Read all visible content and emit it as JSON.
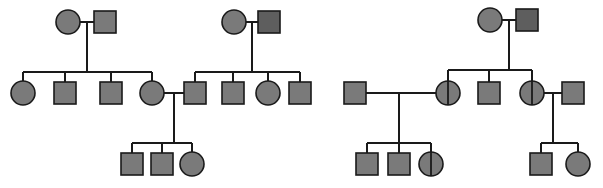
{
  "figure": {
    "width": 603,
    "height": 188,
    "background": "#ffffff"
  },
  "legend": {
    "shape_male": "square",
    "shape_female": "circle",
    "fill_affected_light": "#7a7a7a",
    "fill_affected_dark": "#5e5e5e",
    "stroke": "#1a1a1a",
    "line_color": "#1a1a1a",
    "carrier_marker": "vertical-line"
  },
  "chart_data": {
    "type": "diagram",
    "diagram_kind": "pedigree",
    "generations": 3,
    "symbol_size": {
      "square_side": 22,
      "circle_radius": 12
    },
    "individuals": [
      {
        "id": "L-I-1",
        "sex": "female",
        "shape": "circle",
        "x": 68,
        "y": 22,
        "fill": "#7a7a7a",
        "carrier": false,
        "generation": 1,
        "family": "left"
      },
      {
        "id": "L-I-2",
        "sex": "male",
        "shape": "square",
        "x": 105,
        "y": 22,
        "fill": "#7a7a7a",
        "carrier": false,
        "generation": 1,
        "family": "left"
      },
      {
        "id": "L-II-1",
        "sex": "female",
        "shape": "circle",
        "x": 23,
        "y": 93,
        "fill": "#7a7a7a",
        "carrier": false,
        "generation": 2,
        "family": "left"
      },
      {
        "id": "L-II-2",
        "sex": "male",
        "shape": "square",
        "x": 65,
        "y": 93,
        "fill": "#7a7a7a",
        "carrier": false,
        "generation": 2,
        "family": "left"
      },
      {
        "id": "L-II-3",
        "sex": "male",
        "shape": "square",
        "x": 111,
        "y": 93,
        "fill": "#7a7a7a",
        "carrier": false,
        "generation": 2,
        "family": "left"
      },
      {
        "id": "L-II-4",
        "sex": "female",
        "shape": "circle",
        "x": 152,
        "y": 93,
        "fill": "#7a7a7a",
        "carrier": false,
        "generation": 2,
        "family": "left"
      },
      {
        "id": "M-I-1",
        "sex": "female",
        "shape": "circle",
        "x": 234,
        "y": 22,
        "fill": "#7a7a7a",
        "carrier": false,
        "generation": 1,
        "family": "middle"
      },
      {
        "id": "M-I-2",
        "sex": "male",
        "shape": "square",
        "x": 269,
        "y": 22,
        "fill": "#5e5e5e",
        "carrier": false,
        "generation": 1,
        "family": "middle"
      },
      {
        "id": "M-II-1",
        "sex": "male",
        "shape": "square",
        "x": 195,
        "y": 93,
        "fill": "#7a7a7a",
        "carrier": false,
        "generation": 2,
        "family": "middle"
      },
      {
        "id": "M-II-2",
        "sex": "male",
        "shape": "square",
        "x": 233,
        "y": 93,
        "fill": "#7a7a7a",
        "carrier": false,
        "generation": 2,
        "family": "middle"
      },
      {
        "id": "M-II-3",
        "sex": "female",
        "shape": "circle",
        "x": 268,
        "y": 93,
        "fill": "#7a7a7a",
        "carrier": false,
        "generation": 2,
        "family": "middle"
      },
      {
        "id": "M-II-4",
        "sex": "male",
        "shape": "square",
        "x": 300,
        "y": 93,
        "fill": "#7a7a7a",
        "carrier": false,
        "generation": 2,
        "family": "middle"
      },
      {
        "id": "L-III-1",
        "sex": "male",
        "shape": "square",
        "x": 132,
        "y": 164,
        "fill": "#7a7a7a",
        "carrier": false,
        "generation": 3,
        "family": "left"
      },
      {
        "id": "L-III-2",
        "sex": "male",
        "shape": "square",
        "x": 162,
        "y": 164,
        "fill": "#7a7a7a",
        "carrier": false,
        "generation": 3,
        "family": "left"
      },
      {
        "id": "L-III-3",
        "sex": "female",
        "shape": "circle",
        "x": 192,
        "y": 164,
        "fill": "#7a7a7a",
        "carrier": false,
        "generation": 3,
        "family": "left"
      },
      {
        "id": "R-I-1",
        "sex": "female",
        "shape": "circle",
        "x": 490,
        "y": 20,
        "fill": "#7a7a7a",
        "carrier": false,
        "generation": 1,
        "family": "right"
      },
      {
        "id": "R-I-2",
        "sex": "male",
        "shape": "square",
        "x": 527,
        "y": 20,
        "fill": "#5e5e5e",
        "carrier": false,
        "generation": 1,
        "family": "right"
      },
      {
        "id": "R-II-0",
        "sex": "male",
        "shape": "square",
        "x": 355,
        "y": 93,
        "fill": "#7a7a7a",
        "carrier": false,
        "generation": 2,
        "family": "right"
      },
      {
        "id": "R-II-1",
        "sex": "female",
        "shape": "circle",
        "x": 448,
        "y": 93,
        "fill": "#7a7a7a",
        "carrier": true,
        "generation": 2,
        "family": "right"
      },
      {
        "id": "R-II-2",
        "sex": "male",
        "shape": "square",
        "x": 489,
        "y": 93,
        "fill": "#7a7a7a",
        "carrier": false,
        "generation": 2,
        "family": "right"
      },
      {
        "id": "R-II-3",
        "sex": "female",
        "shape": "circle",
        "x": 532,
        "y": 93,
        "fill": "#7a7a7a",
        "carrier": true,
        "generation": 2,
        "family": "right"
      },
      {
        "id": "R-II-4",
        "sex": "male",
        "shape": "square",
        "x": 573,
        "y": 93,
        "fill": "#7a7a7a",
        "carrier": false,
        "generation": 2,
        "family": "right"
      },
      {
        "id": "R-III-1",
        "sex": "male",
        "shape": "square",
        "x": 367,
        "y": 164,
        "fill": "#7a7a7a",
        "carrier": false,
        "generation": 3,
        "family": "right"
      },
      {
        "id": "R-III-2",
        "sex": "male",
        "shape": "square",
        "x": 399,
        "y": 164,
        "fill": "#7a7a7a",
        "carrier": false,
        "generation": 3,
        "family": "right"
      },
      {
        "id": "R-III-3",
        "sex": "female",
        "shape": "circle",
        "x": 431,
        "y": 164,
        "fill": "#7a7a7a",
        "carrier": true,
        "generation": 3,
        "family": "right"
      },
      {
        "id": "R-III-4",
        "sex": "male",
        "shape": "square",
        "x": 541,
        "y": 164,
        "fill": "#7a7a7a",
        "carrier": false,
        "generation": 3,
        "family": "right"
      },
      {
        "id": "R-III-5",
        "sex": "female",
        "shape": "circle",
        "x": 578,
        "y": 164,
        "fill": "#7a7a7a",
        "carrier": false,
        "generation": 3,
        "family": "right"
      }
    ],
    "matings": [
      {
        "id": "mate-L-I",
        "partners": [
          "L-I-1",
          "L-I-2"
        ],
        "y": 22,
        "x1": 80,
        "x2": 94,
        "drop_x": 87,
        "drop_to": 72
      },
      {
        "id": "mate-M-I",
        "partners": [
          "M-I-1",
          "M-I-2"
        ],
        "y": 22,
        "x1": 246,
        "x2": 258,
        "drop_x": 252,
        "drop_to": 72
      },
      {
        "id": "mate-R-I",
        "partners": [
          "R-I-1",
          "R-I-2"
        ],
        "y": 20,
        "x1": 502,
        "x2": 516,
        "drop_x": 509,
        "drop_to": 70
      },
      {
        "id": "mate-L-M",
        "partners": [
          "L-II-4",
          "M-II-1"
        ],
        "y": 93,
        "x1": 164,
        "x2": 184,
        "drop_x": 174,
        "drop_to": 143
      },
      {
        "id": "mate-R-A",
        "partners": [
          "R-II-0",
          "R-II-1"
        ],
        "y": 93,
        "x1": 366,
        "x2": 436,
        "drop_x": 399,
        "drop_to": 143
      },
      {
        "id": "mate-R-B",
        "partners": [
          "R-II-3",
          "R-II-4"
        ],
        "y": 93,
        "x1": 544,
        "x2": 562,
        "drop_x": 553,
        "drop_to": 143
      }
    ],
    "sibships": [
      {
        "id": "sib-L-II",
        "parent_mating": "mate-L-I",
        "bar_y": 72,
        "x1": 23,
        "x2": 152,
        "children": [
          "L-II-1",
          "L-II-2",
          "L-II-3",
          "L-II-4"
        ]
      },
      {
        "id": "sib-M-II",
        "parent_mating": "mate-M-I",
        "bar_y": 72,
        "x1": 195,
        "x2": 300,
        "children": [
          "M-II-1",
          "M-II-2",
          "M-II-3",
          "M-II-4"
        ]
      },
      {
        "id": "sib-L-III",
        "parent_mating": "mate-L-M",
        "bar_y": 143,
        "x1": 132,
        "x2": 192,
        "children": [
          "L-III-1",
          "L-III-2",
          "L-III-3"
        ]
      },
      {
        "id": "sib-R-II",
        "parent_mating": "mate-R-I",
        "bar_y": 70,
        "x1": 448,
        "x2": 532,
        "children": [
          "R-II-1",
          "R-II-2",
          "R-II-3"
        ]
      },
      {
        "id": "sib-R-IIIa",
        "parent_mating": "mate-R-A",
        "bar_y": 143,
        "x1": 367,
        "x2": 431,
        "children": [
          "R-III-1",
          "R-III-2",
          "R-III-3"
        ]
      },
      {
        "id": "sib-R-IIIb",
        "parent_mating": "mate-R-B",
        "bar_y": 143,
        "x1": 541,
        "x2": 578,
        "children": [
          "R-III-4",
          "R-III-5"
        ]
      }
    ]
  }
}
